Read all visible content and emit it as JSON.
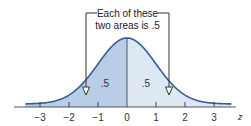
{
  "diagram": {
    "callout": {
      "line1": "Each of these",
      "line2": "two areas is .5"
    },
    "areas": [
      {
        "side": "left",
        "label": ".5",
        "color": "#b9cde6"
      },
      {
        "side": "right",
        "label": ".5",
        "color": "#dee8f3"
      }
    ],
    "axis": {
      "variable": "z",
      "ticks": [
        {
          "value": -3,
          "label": "−3"
        },
        {
          "value": -2,
          "label": "−2"
        },
        {
          "value": -1,
          "label": "−1"
        },
        {
          "value": 0,
          "label": "0"
        },
        {
          "value": 1,
          "label": "1"
        },
        {
          "value": 2,
          "label": "2"
        },
        {
          "value": 3,
          "label": "3"
        }
      ]
    },
    "colors": {
      "curve": "#2d5fa8",
      "axis": "#555555",
      "bracket": "#333333"
    }
  }
}
